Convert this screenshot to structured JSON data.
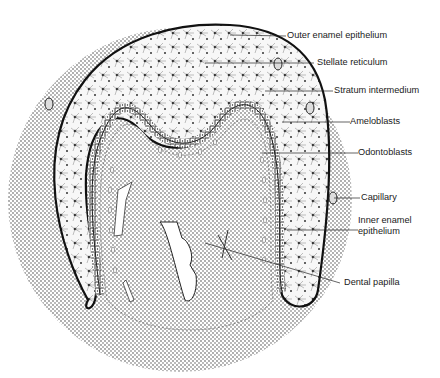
{
  "figure": {
    "labels": [
      {
        "id": "outer_enamel_epithelium",
        "text": "Outer enamel epithelium"
      },
      {
        "id": "stellate_reticulum",
        "text": "Stellate reticulum"
      },
      {
        "id": "stratum_intermedium",
        "text": "Stratum intermedium"
      },
      {
        "id": "ameloblasts",
        "text": "Ameloblasts"
      },
      {
        "id": "odontoblasts",
        "text": "Odontoblasts"
      },
      {
        "id": "capillary",
        "text": "Capillary"
      },
      {
        "id": "inner_enamel_epithelium",
        "text": "Inner enamel\nepithelium"
      },
      {
        "id": "dental_papilla",
        "text": "Dental papilla"
      }
    ]
  },
  "colors": {
    "background": "#ffffff",
    "ink": "#1a1a1a",
    "mesenchyme_dots": "#8a8a8a",
    "enamel_organ_fill": "#f4f4f4"
  }
}
